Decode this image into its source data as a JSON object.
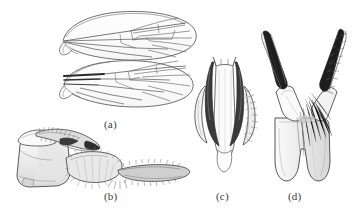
{
  "figure": {
    "kind": "scientific-illustration-plate",
    "background_color": "#ffffff",
    "ink_color": "#4a4a4a",
    "dark_accent_color": "#1c1c1c",
    "fill_light": "#f2f2f2",
    "fill_shade": "#dcdcdc",
    "panels": [
      {
        "key": "a",
        "label": "(a)",
        "caption": "(a)",
        "subject": "wings",
        "description": "Two detached wings in dorsal view, upper and lower, showing longitudinal veins, forked radial and medial veins and a basal cell; lower wing has thickened dark basal veins."
      },
      {
        "key": "b",
        "label": "(b)",
        "caption": "(b)",
        "subject": "male-terminalia-lateral",
        "description": "Lateral view of male terminalia: rounded basal segment with a dorsal setose lobe, a stout hairy gonocoxite and an elongate tapering gonostylus fringed with fine setae extending to the right."
      },
      {
        "key": "c",
        "label": "(c)",
        "caption": "(c)",
        "subject": "aedeagal-complex-ventral",
        "description": "Ventral view of the aedeagal complex: pale median aedeagus flanked by a pair of dark sclerotised parameres and slender outer lateral arms, one bearing dense setae."
      },
      {
        "key": "d",
        "label": "(d)",
        "caption": "(d)",
        "subject": "gonocoxites-forceps",
        "description": "Gonocoxites and gonostyli in V arrangement on a broad bilobed basal plate with a median notch; each arm terminates in a slender dark claw-like tip, the right arm densely setose."
      }
    ]
  },
  "labels": {
    "a": "(a)",
    "b": "(b)",
    "c": "(c)",
    "d": "(d)"
  }
}
